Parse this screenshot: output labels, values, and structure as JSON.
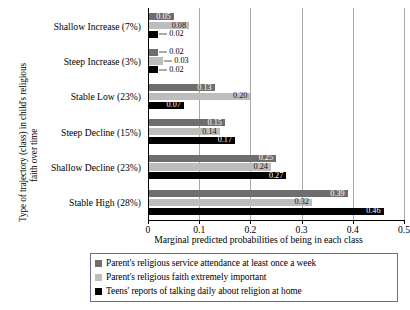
{
  "chart_data": {
    "type": "bar",
    "orientation": "horizontal",
    "title": "",
    "xlabel": "Marginal predicted probabilities of being in each class",
    "ylabel": "Type of trajectory (class) in child's religious faith over time",
    "ylabel_lines": [
      "Type of trajectory (class) in child's religious",
      "faith over time"
    ],
    "xlim": [
      0,
      0.5
    ],
    "xticks": [
      0,
      0.1,
      0.2,
      0.3,
      0.4,
      0.5
    ],
    "xticklabels": [
      "0",
      "0.1",
      "0.2",
      "0.3",
      "0.4",
      "0.5"
    ],
    "grid": "vertical",
    "legend_position": "bottom",
    "categories": [
      "Shallow Increase (7%)",
      "Steep Increase (3%)",
      "Stable Low (23%)",
      "Steep Decline (15%)",
      "Shallow Decline (23%)",
      "Stable High (28%)"
    ],
    "series": [
      {
        "name": "Parent's religious service attendance at least once a week",
        "color": "#6e6e6e",
        "values": [
          0.05,
          0.02,
          0.13,
          0.15,
          0.25,
          0.39
        ],
        "labels": [
          "0.05",
          "0.02",
          "0.13",
          "0.15",
          "0.25",
          "0.39"
        ]
      },
      {
        "name": "Parent's religious faith extremely important",
        "color": "#bdbdbd",
        "values": [
          0.08,
          0.03,
          0.2,
          0.14,
          0.24,
          0.32
        ],
        "labels": [
          "0.08",
          "0.03",
          "0.20",
          "0.14",
          "0.24",
          "0.32"
        ]
      },
      {
        "name": "Teens' reports of talking daily about religion at home",
        "color": "#000000",
        "values": [
          0.02,
          0.02,
          0.07,
          0.17,
          0.27,
          0.46
        ],
        "labels": [
          "0.02",
          "0.02",
          "0.07",
          "0.17",
          "0.27",
          "0.46"
        ]
      }
    ]
  },
  "legend": {
    "items": [
      {
        "label": "Parent's religious service attendance at least once a week",
        "color": "#6e6e6e"
      },
      {
        "label": "Parent's religious faith extremely important",
        "color": "#bdbdbd"
      },
      {
        "label": "Teens' reports of talking daily about religion at home",
        "color": "#000000"
      }
    ]
  }
}
